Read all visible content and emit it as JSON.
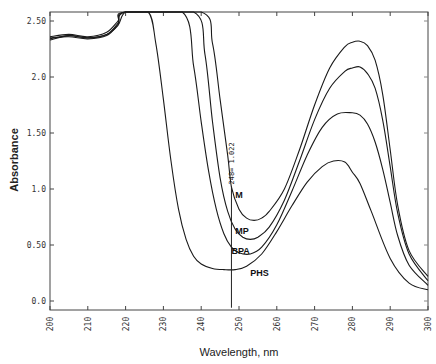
{
  "chart_data": {
    "type": "line",
    "title": "",
    "xlabel": "Wavelength, nm",
    "ylabel": "Absorbance",
    "xlim": [
      200,
      300
    ],
    "ylim": [
      0,
      2.6
    ],
    "xticks": [
      "200",
      "210",
      "220",
      "230",
      "240",
      "250",
      "260",
      "270",
      "280",
      "290",
      "300"
    ],
    "yticks": [
      "0.0",
      "0.50",
      "1.0",
      "1.50",
      "2.0",
      "2.50"
    ],
    "grid": false,
    "legend": "inline labels",
    "annotation": {
      "text": "248= 1.022",
      "x": 248,
      "y": 1.022
    },
    "series": [
      {
        "name": "M",
        "label_pos": [
          249,
          0.92
        ],
        "x": [
          200,
          205,
          210,
          215,
          218,
          220,
          240,
          243,
          245,
          247,
          248,
          250,
          252,
          254,
          256,
          258,
          262,
          266,
          270,
          274,
          278,
          280,
          282,
          284,
          286,
          288,
          290,
          292,
          295,
          300
        ],
        "y": [
          2.36,
          2.38,
          2.36,
          2.4,
          2.5,
          2.6,
          2.6,
          2.3,
          1.8,
          1.3,
          1.02,
          0.82,
          0.74,
          0.72,
          0.74,
          0.8,
          1.0,
          1.35,
          1.75,
          2.08,
          2.27,
          2.31,
          2.32,
          2.28,
          2.15,
          1.85,
          1.35,
          0.85,
          0.45,
          0.22
        ]
      },
      {
        "name": "MP",
        "label_pos": [
          249,
          0.6
        ],
        "x": [
          200,
          205,
          210,
          215,
          218,
          220,
          238,
          241,
          243,
          245,
          247,
          249,
          251,
          253,
          255,
          258,
          262,
          266,
          270,
          274,
          278,
          280,
          282,
          284,
          286,
          288,
          290,
          292,
          295,
          300
        ],
        "y": [
          2.34,
          2.37,
          2.35,
          2.38,
          2.48,
          2.6,
          2.6,
          2.2,
          1.6,
          1.1,
          0.8,
          0.64,
          0.57,
          0.55,
          0.57,
          0.66,
          0.9,
          1.25,
          1.62,
          1.9,
          2.05,
          2.08,
          2.09,
          2.03,
          1.9,
          1.62,
          1.2,
          0.78,
          0.42,
          0.18
        ]
      },
      {
        "name": "BPA",
        "label_pos": [
          248,
          0.42
        ],
        "x": [
          200,
          205,
          210,
          215,
          218,
          220,
          235,
          238,
          240,
          242,
          244,
          246,
          248,
          250,
          253,
          256,
          260,
          264,
          268,
          272,
          276,
          280,
          282,
          284,
          286,
          288,
          290,
          292,
          295,
          300
        ],
        "y": [
          2.35,
          2.36,
          2.34,
          2.37,
          2.47,
          2.6,
          2.6,
          2.1,
          1.6,
          1.15,
          0.82,
          0.6,
          0.48,
          0.43,
          0.42,
          0.48,
          0.68,
          0.98,
          1.3,
          1.55,
          1.67,
          1.68,
          1.66,
          1.58,
          1.42,
          1.18,
          0.88,
          0.58,
          0.32,
          0.14
        ]
      },
      {
        "name": "PHS",
        "label_pos": [
          253,
          0.22
        ],
        "x": [
          200,
          205,
          210,
          215,
          218,
          220,
          226,
          228,
          230,
          232,
          234,
          236,
          238,
          240,
          243,
          246,
          249,
          252,
          256,
          260,
          264,
          268,
          272,
          275,
          278,
          280,
          282,
          285,
          290,
          295,
          300
        ],
        "y": [
          2.33,
          2.37,
          2.35,
          2.38,
          2.46,
          2.6,
          2.6,
          2.3,
          1.8,
          1.25,
          0.82,
          0.55,
          0.4,
          0.33,
          0.29,
          0.28,
          0.28,
          0.31,
          0.42,
          0.62,
          0.85,
          1.06,
          1.2,
          1.25,
          1.24,
          1.15,
          1.05,
          0.8,
          0.38,
          0.16,
          0.1
        ]
      }
    ]
  }
}
